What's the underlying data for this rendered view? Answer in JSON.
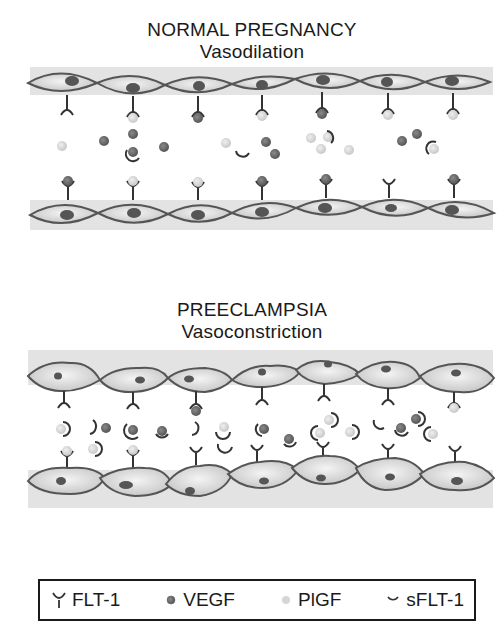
{
  "panels": [
    {
      "title": "NORMAL PREGNANCY",
      "subtitle": "Vasodilation",
      "condition": "normal"
    },
    {
      "title": "PREECLAMPSIA",
      "subtitle": "Vasoconstriction",
      "condition": "preeclampsia"
    }
  ],
  "legend": {
    "items": [
      {
        "symbol": "receptor-icon",
        "label": "FLT-1"
      },
      {
        "symbol": "dark-dot-icon",
        "label": "VEGF"
      },
      {
        "symbol": "light-dot-icon",
        "label": "PlGF"
      },
      {
        "symbol": "arc-icon",
        "label": "sFLT-1"
      }
    ]
  },
  "colors": {
    "band": "#e3e3e3",
    "cell_fill": "#cfcfcf",
    "cell_highlight": "#f2f2f2",
    "cell_stroke": "#555555",
    "nucleus": "#555555",
    "vegf": "#6e6e6e",
    "plgf": "#d9d9d9",
    "line": "#333333"
  }
}
